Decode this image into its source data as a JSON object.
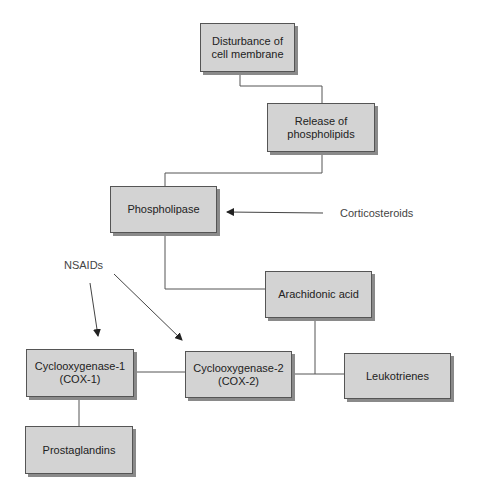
{
  "diagram": {
    "nodes": [
      {
        "id": "disturbance",
        "label": "Disturbance of\ncell membrane"
      },
      {
        "id": "release",
        "label": "Release of\nphospholipids"
      },
      {
        "id": "phospholipase",
        "label": "Phospholipase"
      },
      {
        "id": "arachidonic",
        "label": "Arachidonic acid"
      },
      {
        "id": "cox1",
        "label": "Cyclooxygenase-1\n(COX-1)"
      },
      {
        "id": "cox2",
        "label": "Cyclooxygenase-2\n(COX-2)"
      },
      {
        "id": "leukotrienes",
        "label": "Leukotrienes"
      },
      {
        "id": "prostaglandins",
        "label": "Prostaglandins"
      }
    ],
    "labels": {
      "corticosteroids": "Corticosteroids",
      "nsaids": "NSAIDs"
    },
    "edges": [
      {
        "from": "disturbance",
        "to": "release",
        "type": "line"
      },
      {
        "from": "release",
        "to": "phospholipase",
        "type": "line"
      },
      {
        "from": "phospholipase",
        "to": "arachidonic",
        "type": "line"
      },
      {
        "from": "arachidonic",
        "to": "cox2",
        "type": "line"
      },
      {
        "from": "arachidonic",
        "to": "leukotrienes",
        "type": "line"
      },
      {
        "from": "cox1",
        "to": "cox2",
        "type": "line"
      },
      {
        "from": "cox1",
        "to": "prostaglandins",
        "type": "line"
      },
      {
        "from": "corticosteroids",
        "to": "phospholipase",
        "type": "arrow"
      },
      {
        "from": "nsaids",
        "to": "cox1",
        "type": "arrow"
      },
      {
        "from": "nsaids",
        "to": "cox2",
        "type": "arrow"
      }
    ],
    "colors": {
      "box_fill": "#d3d3d3",
      "box_border": "#555555",
      "shadow": "#8a8a8a",
      "line": "#444444"
    }
  }
}
